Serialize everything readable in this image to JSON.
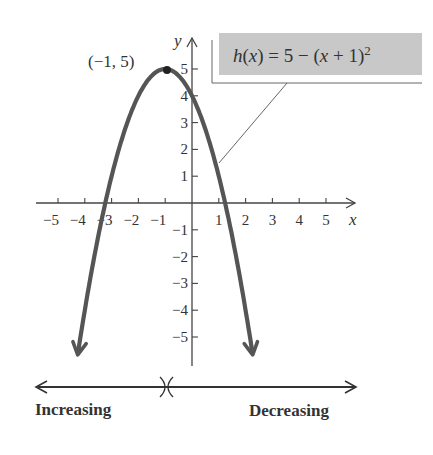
{
  "chart_data": {
    "type": "line",
    "function": "h(x) = 5 - (x + 1)^2",
    "series": [
      {
        "name": "h(x) = 5 − (x + 1)²",
        "x": [
          -4.3,
          -4,
          -3.5,
          -3,
          -2.5,
          -2,
          -1.5,
          -1,
          -0.5,
          0,
          0.5,
          1,
          1.5,
          2,
          2.3
        ],
        "y": [
          -5.89,
          -4,
          -1.25,
          1,
          2.75,
          4,
          4.75,
          5,
          4.75,
          4,
          2.75,
          1,
          -1.25,
          -4,
          -5.89
        ],
        "color": "#555555"
      }
    ],
    "annotations": [
      {
        "label": "(−1, 5)",
        "x": -1,
        "y": 5,
        "type": "vertex-point"
      }
    ],
    "xlabel": "x",
    "ylabel": "y",
    "xlim": [
      -5.8,
      6
    ],
    "ylim": [
      -6,
      6
    ],
    "xticks": [
      -5,
      -4,
      -3,
      -2,
      -1,
      1,
      2,
      3,
      4,
      5
    ],
    "yticks": [
      -5,
      -4,
      -3,
      -2,
      -1,
      1,
      2,
      3,
      4,
      5
    ],
    "grid": false,
    "legend": {
      "text": "h(x) = 5 − (x + 1)²",
      "position": "top-right",
      "background": "#c8c8c8"
    },
    "intervals": [
      {
        "label": "Increasing",
        "range": "(-∞, -1)"
      },
      {
        "label": "Decreasing",
        "range": "(-1, ∞)"
      }
    ]
  },
  "labels": {
    "vertex": "(−1, 5)",
    "x_axis": "x",
    "y_axis": "y",
    "equation_prefix": "h(x) = 5 − (x + 1)",
    "equation_exp": "2",
    "increasing": "Increasing",
    "decreasing": "Decreasing",
    "xticks": [
      "−5",
      "−4",
      "−3",
      "−2",
      "−1",
      "1",
      "2",
      "3",
      "4",
      "5"
    ],
    "yticks": [
      "5",
      "4",
      "3",
      "2",
      "1",
      "−1",
      "−2",
      "−3",
      "−4",
      "−5"
    ]
  }
}
